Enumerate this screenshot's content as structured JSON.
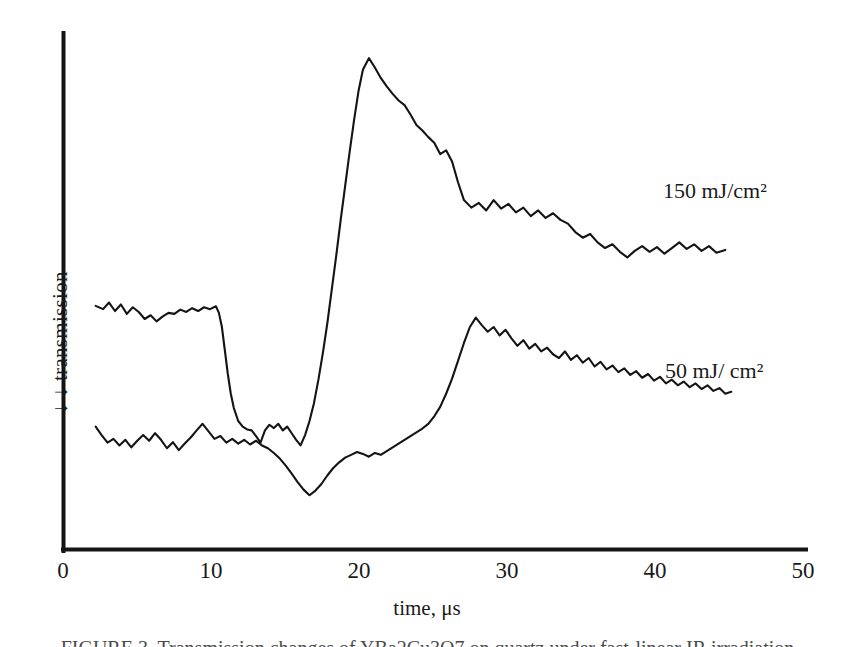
{
  "figure": {
    "caption": "FIGURE 3.  Transmission changes of YBa2Cu3O7 on quartz under fast-linear IR irradiation"
  },
  "chart_data": {
    "type": "line",
    "title": "",
    "xlabel": "time, μs",
    "ylabel": "↓  ↓  transmission",
    "xlim": [
      0,
      50
    ],
    "xticks": [
      0,
      10,
      20,
      30,
      40,
      50
    ],
    "xticklabels": [
      "0",
      "10",
      "20",
      "30",
      "40",
      "50"
    ],
    "yticks": [],
    "yticklabels": [],
    "grid": false,
    "legend": "inline-annotations",
    "axis_color": "#141414",
    "trace_color": "#141414",
    "note": "y-axis is uncalibrated transmission; downward arrows indicate decreasing transmission direction. Traces are vertically offset for clarity.",
    "annotations": [
      {
        "name": "annotation-150",
        "text": "150 mJ/cm²",
        "x": 40.6,
        "series": "high-fluence"
      },
      {
        "name": "annotation-50",
        "text": "50 mJ/ cm²",
        "x": 40.7,
        "series": "low-fluence"
      }
    ],
    "series": [
      {
        "name": "150 mJ/cm2 transmission transient",
        "label": "150 mJ/cm²",
        "color": "#141414",
        "x": [
          2.2,
          2.7,
          3.1,
          3.5,
          3.9,
          4.3,
          4.7,
          5.1,
          5.5,
          5.9,
          6.3,
          6.7,
          7.1,
          7.5,
          7.9,
          8.3,
          8.7,
          9.1,
          9.5,
          9.9,
          10.3,
          10.5,
          10.7,
          10.9,
          11.1,
          11.3,
          11.5,
          11.8,
          12.1,
          12.4,
          12.7,
          13.0,
          13.3,
          13.6,
          13.9,
          14.2,
          14.5,
          14.8,
          15.1,
          15.4,
          15.7,
          16.0,
          16.3,
          16.6,
          16.9,
          17.2,
          17.5,
          17.8,
          18.1,
          18.4,
          18.7,
          19.0,
          19.3,
          19.6,
          19.9,
          20.2,
          20.6,
          21.0,
          21.4,
          21.8,
          22.2,
          22.6,
          23.0,
          23.4,
          23.8,
          24.2,
          24.6,
          25.0,
          25.4,
          25.8,
          26.2,
          26.6,
          27.0,
          27.5,
          28.0,
          28.5,
          29.0,
          29.5,
          30.0,
          30.5,
          31.0,
          31.5,
          32.0,
          32.5,
          33.0,
          33.5,
          34.0,
          34.5,
          35.0,
          35.5,
          36.0,
          36.5,
          37.0,
          37.5,
          38.0,
          38.5,
          39.0,
          39.5,
          40.0,
          40.5,
          41.0,
          41.5,
          42.0,
          42.5,
          43.0,
          43.5,
          44.0,
          44.6
        ],
        "y": [
          0.555,
          0.562,
          0.548,
          0.566,
          0.552,
          0.572,
          0.558,
          0.568,
          0.583,
          0.575,
          0.588,
          0.578,
          0.57,
          0.572,
          0.563,
          0.568,
          0.56,
          0.566,
          0.558,
          0.562,
          0.556,
          0.57,
          0.6,
          0.65,
          0.7,
          0.742,
          0.772,
          0.8,
          0.812,
          0.818,
          0.82,
          0.832,
          0.846,
          0.82,
          0.808,
          0.815,
          0.806,
          0.82,
          0.812,
          0.826,
          0.84,
          0.852,
          0.83,
          0.8,
          0.762,
          0.712,
          0.655,
          0.592,
          0.52,
          0.448,
          0.372,
          0.3,
          0.228,
          0.16,
          0.098,
          0.052,
          0.028,
          0.048,
          0.07,
          0.088,
          0.104,
          0.118,
          0.128,
          0.148,
          0.17,
          0.182,
          0.196,
          0.208,
          0.232,
          0.224,
          0.248,
          0.292,
          0.33,
          0.346,
          0.336,
          0.352,
          0.33,
          0.348,
          0.338,
          0.356,
          0.346,
          0.364,
          0.352,
          0.368,
          0.358,
          0.372,
          0.38,
          0.398,
          0.41,
          0.402,
          0.42,
          0.432,
          0.424,
          0.44,
          0.452,
          0.438,
          0.428,
          0.44,
          0.43,
          0.444,
          0.432,
          0.42,
          0.434,
          0.424,
          0.438,
          0.428,
          0.442,
          0.436
        ]
      },
      {
        "name": "50 mJ/cm2 transmission transient",
        "label": "50 mJ/ cm²",
        "color": "#141414",
        "x": [
          2.2,
          2.6,
          3.0,
          3.4,
          3.8,
          4.2,
          4.6,
          5.0,
          5.4,
          5.8,
          6.2,
          6.6,
          7.0,
          7.4,
          7.8,
          8.2,
          8.6,
          9.0,
          9.4,
          9.8,
          10.2,
          10.6,
          11.0,
          11.4,
          11.8,
          12.2,
          12.6,
          13.0,
          13.4,
          13.8,
          14.2,
          14.6,
          15.0,
          15.4,
          15.8,
          16.2,
          16.6,
          17.0,
          17.4,
          17.8,
          18.2,
          18.6,
          19.0,
          19.4,
          19.8,
          20.2,
          20.6,
          21.0,
          21.4,
          21.8,
          22.2,
          22.6,
          23.0,
          23.4,
          23.8,
          24.2,
          24.6,
          25.0,
          25.4,
          25.8,
          26.2,
          26.6,
          27.0,
          27.4,
          27.8,
          28.2,
          28.6,
          29.0,
          29.4,
          29.8,
          30.2,
          30.6,
          31.0,
          31.4,
          31.8,
          32.2,
          32.6,
          33.0,
          33.4,
          33.8,
          34.2,
          34.6,
          35.0,
          35.4,
          35.8,
          36.2,
          36.6,
          37.0,
          37.4,
          37.8,
          38.2,
          38.6,
          39.0,
          39.4,
          39.8,
          40.2,
          40.6,
          41.0,
          41.4,
          41.8,
          42.2,
          42.6,
          43.0,
          43.4,
          43.8,
          44.2,
          44.6,
          45.0
        ],
        "y": [
          0.812,
          0.83,
          0.846,
          0.838,
          0.852,
          0.84,
          0.856,
          0.842,
          0.83,
          0.842,
          0.826,
          0.84,
          0.858,
          0.845,
          0.862,
          0.848,
          0.835,
          0.82,
          0.806,
          0.822,
          0.838,
          0.832,
          0.846,
          0.838,
          0.848,
          0.84,
          0.85,
          0.842,
          0.852,
          0.858,
          0.868,
          0.88,
          0.895,
          0.912,
          0.93,
          0.946,
          0.958,
          0.948,
          0.934,
          0.916,
          0.9,
          0.888,
          0.878,
          0.872,
          0.866,
          0.87,
          0.876,
          0.868,
          0.872,
          0.864,
          0.856,
          0.848,
          0.84,
          0.832,
          0.824,
          0.816,
          0.806,
          0.79,
          0.77,
          0.742,
          0.71,
          0.672,
          0.634,
          0.6,
          0.58,
          0.596,
          0.61,
          0.6,
          0.618,
          0.606,
          0.624,
          0.64,
          0.628,
          0.646,
          0.636,
          0.652,
          0.644,
          0.658,
          0.666,
          0.652,
          0.67,
          0.66,
          0.676,
          0.666,
          0.684,
          0.674,
          0.69,
          0.682,
          0.696,
          0.688,
          0.702,
          0.694,
          0.708,
          0.7,
          0.714,
          0.706,
          0.72,
          0.712,
          0.724,
          0.716,
          0.728,
          0.72,
          0.732,
          0.724,
          0.736,
          0.73,
          0.742,
          0.738
        ]
      }
    ]
  }
}
